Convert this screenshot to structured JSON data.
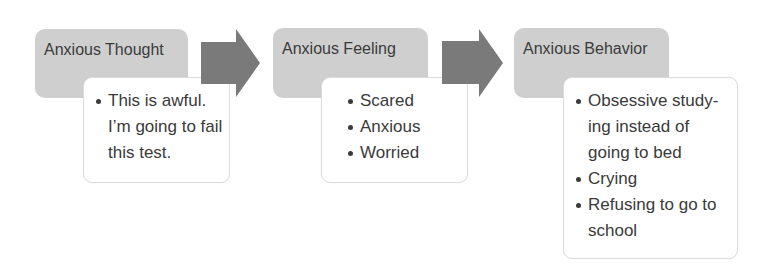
{
  "diagram": {
    "type": "process-flow",
    "colors": {
      "header_fill": "#cfcfcf",
      "arrow_fill": "#7a7a7a",
      "detail_fill": "#ffffff",
      "detail_border": "#dcdcdc",
      "text": "#3a3a3a"
    },
    "steps": [
      {
        "title": "Anxious Thought",
        "items": [
          "This is awful. I’m going to fail this test."
        ]
      },
      {
        "title": "Anxious Feeling",
        "items": [
          "Scared",
          "Anxious",
          "Worried"
        ]
      },
      {
        "title": "Anxious Behavior",
        "items": [
          "Obsessive study-ing instead of going to bed",
          "Crying",
          "Refusing to go to school"
        ]
      }
    ],
    "arrows": [
      {
        "from": "Anxious Thought",
        "to": "Anxious Feeling",
        "icon": "right-arrow-icon"
      },
      {
        "from": "Anxious Feeling",
        "to": "Anxious Behavior",
        "icon": "right-arrow-icon"
      }
    ]
  }
}
